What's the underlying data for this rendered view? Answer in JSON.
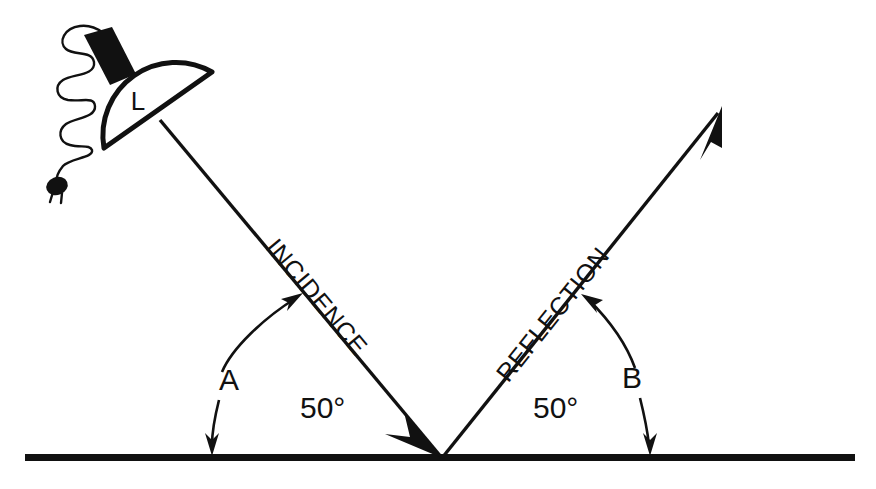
{
  "figure": {
    "kind": "optics-reflection-diagram",
    "background_color": "#ffffff",
    "ink_color": "#111111"
  },
  "lamp": {
    "label": "L",
    "name": "lamp",
    "shade_shape": "half-disc",
    "neck_color": "#111111",
    "cord": {
      "name": "power-cord",
      "loops": 3,
      "plug": "two-prong-plug"
    }
  },
  "rays": {
    "incidence": {
      "label": "INCIDENCE",
      "direction": "down-right",
      "arrowhead": "at-surface"
    },
    "reflection": {
      "label": "REFLECTION",
      "direction": "up-right",
      "arrowhead": "at-tip"
    }
  },
  "angles": {
    "left": {
      "marker": "A",
      "value": "50°"
    },
    "right": {
      "marker": "B",
      "value": "50°"
    }
  },
  "surface": {
    "name": "reflecting-surface",
    "color": "#111111"
  }
}
